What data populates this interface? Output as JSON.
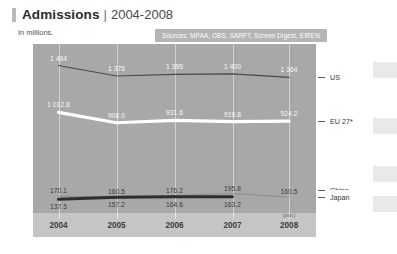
{
  "header": {
    "title": "Admissions",
    "separator": "|",
    "range": "2004-2008",
    "subtitle": "In millions.",
    "sources": "Sources: MPAA, OBS, SARFT, Screen Digest, EIREN"
  },
  "axis": {
    "y_ticks": [
      "1 600",
      "1 200",
      "800",
      "400",
      "0"
    ],
    "y_values": [
      1600,
      1200,
      800,
      400,
      0
    ],
    "x_labels": [
      "2004",
      "2005",
      "2006",
      "2007",
      "2008"
    ],
    "x_note": "(prov.)"
  },
  "legend": [
    {
      "label": "US"
    },
    {
      "label": "EU 27*"
    },
    {
      "label": "China"
    },
    {
      "label": "Japan"
    }
  ],
  "colors": {
    "panel": "#a8a8a8",
    "gridline": "#d8d8d8",
    "us_line": "#4a4a4a",
    "eu_line": "#ffffff",
    "china_line": "#8e8e8e",
    "japan_line": "#2e2e2e",
    "axis_band": "#c5c5c5",
    "sources_pill": "#b5b5b5"
  },
  "chart_data": {
    "type": "line",
    "title": "Admissions | 2004-2008",
    "subtitle": "In millions.",
    "xlabel": "",
    "ylabel": "",
    "x": [
      "2004",
      "2005",
      "2006",
      "2007",
      "2008"
    ],
    "ylim": [
      0,
      1700
    ],
    "yticks": [
      0,
      400,
      800,
      1200,
      1600
    ],
    "grid": "vertical",
    "legend_position": "right",
    "annotations": [
      "Sources: MPAA, OBS, SARFT, Screen Digest, EIREN",
      "(prov.)"
    ],
    "series": [
      {
        "name": "US",
        "values": [
          1484,
          1378,
          1395,
          1400,
          1364
        ],
        "labels": [
          "1 484",
          "1 378",
          "1 395",
          "1 400",
          "1 364"
        ]
      },
      {
        "name": "EU 27*",
        "values": [
          1012.8,
          908.0,
          931.6,
          919.8,
          924.2
        ],
        "labels": [
          "1 012.8",
          "908.0",
          "931.6",
          "919.8",
          "924.2"
        ]
      },
      {
        "name": "China",
        "values": [
          170.1,
          160.5,
          176.2,
          195.8,
          160.5
        ],
        "labels": [
          "170.1",
          "160.5",
          "176.2",
          "195.8",
          "160.5"
        ]
      },
      {
        "name": "Japan",
        "values": [
          137.5,
          157.2,
          164.6,
          163.2,
          null
        ],
        "labels": [
          "137.5",
          "157.2",
          "164.6",
          "163.2",
          ""
        ]
      }
    ]
  }
}
